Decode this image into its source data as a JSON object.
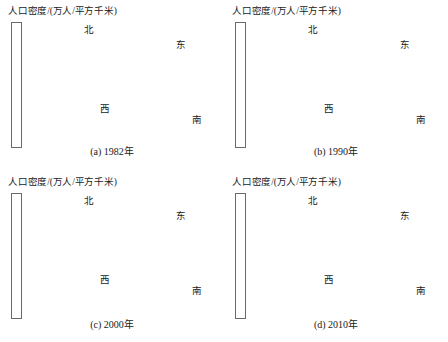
{
  "figure": {
    "background_color": "#ffffff",
    "panel_count": 4,
    "layout": "2x2 grid of 3D surface plots"
  },
  "chart_data": {
    "type": "heatmap",
    "title": "人口密度/(万人/平方千米)",
    "subtitle": "",
    "xlabel": "",
    "ylabel": "",
    "zlabel": "人口密度/(万人/平方千米)",
    "grid": false,
    "legend_position": "left",
    "colormap": "grayscale-inverted",
    "projection": "3d-surface",
    "direction_labels": {
      "north": "北",
      "east": "东",
      "west": "西",
      "south": "南"
    },
    "panels": [
      {
        "id": "a",
        "caption": "(a) 1982年",
        "year": 1982,
        "colorbar": {
          "title": "人口密度/(万人/平方千米)",
          "ticks": [
            11,
            10,
            9,
            8,
            7,
            6,
            5,
            4
          ],
          "vmin": 4,
          "vmax": 11.5
        },
        "peaks": [
          {
            "x": 0.42,
            "y": 0.3,
            "amp": 1.0,
            "sx": 0.045,
            "sy": 0.05
          },
          {
            "x": 0.5,
            "y": 0.47,
            "amp": 0.78,
            "sx": 0.038,
            "sy": 0.042
          },
          {
            "x": 0.57,
            "y": 0.45,
            "amp": 0.88,
            "sx": 0.04,
            "sy": 0.045
          },
          {
            "x": 0.63,
            "y": 0.5,
            "amp": 0.92,
            "sx": 0.045,
            "sy": 0.048
          },
          {
            "x": 0.36,
            "y": 0.52,
            "amp": 0.62,
            "sx": 0.04,
            "sy": 0.045
          },
          {
            "x": 0.46,
            "y": 0.62,
            "amp": 0.55,
            "sx": 0.042,
            "sy": 0.048
          },
          {
            "x": 0.58,
            "y": 0.66,
            "amp": 0.48,
            "sx": 0.045,
            "sy": 0.05
          },
          {
            "x": 0.72,
            "y": 0.63,
            "amp": 0.52,
            "sx": 0.042,
            "sy": 0.046
          },
          {
            "x": 0.3,
            "y": 0.38,
            "amp": 0.3,
            "sx": 0.09,
            "sy": 0.09
          },
          {
            "x": 0.55,
            "y": 0.5,
            "amp": 0.26,
            "sx": 0.18,
            "sy": 0.16
          }
        ],
        "base_level": 0.1
      },
      {
        "id": "b",
        "caption": "(b) 1990年",
        "year": 1990,
        "colorbar": {
          "title": "人口密度/(万人/平方千米)",
          "ticks": [
            11,
            10,
            9,
            8,
            7,
            6,
            5,
            4
          ],
          "vmin": 4,
          "vmax": 11.5
        },
        "peaks": [
          {
            "x": 0.4,
            "y": 0.26,
            "amp": 0.95,
            "sx": 0.048,
            "sy": 0.052
          },
          {
            "x": 0.48,
            "y": 0.44,
            "amp": 0.85,
            "sx": 0.04,
            "sy": 0.044
          },
          {
            "x": 0.55,
            "y": 0.42,
            "amp": 1.0,
            "sx": 0.042,
            "sy": 0.046
          },
          {
            "x": 0.61,
            "y": 0.46,
            "amp": 0.96,
            "sx": 0.044,
            "sy": 0.048
          },
          {
            "x": 0.67,
            "y": 0.44,
            "amp": 0.82,
            "sx": 0.04,
            "sy": 0.044
          },
          {
            "x": 0.34,
            "y": 0.5,
            "amp": 0.66,
            "sx": 0.044,
            "sy": 0.048
          },
          {
            "x": 0.44,
            "y": 0.6,
            "amp": 0.6,
            "sx": 0.044,
            "sy": 0.05
          },
          {
            "x": 0.6,
            "y": 0.62,
            "amp": 0.58,
            "sx": 0.046,
            "sy": 0.05
          },
          {
            "x": 0.74,
            "y": 0.58,
            "amp": 0.62,
            "sx": 0.044,
            "sy": 0.048
          },
          {
            "x": 0.28,
            "y": 0.36,
            "amp": 0.32,
            "sx": 0.095,
            "sy": 0.095
          },
          {
            "x": 0.55,
            "y": 0.48,
            "amp": 0.3,
            "sx": 0.19,
            "sy": 0.17
          }
        ],
        "base_level": 0.11
      },
      {
        "id": "c",
        "caption": "(c) 2000年",
        "year": 2000,
        "colorbar": {
          "title": "人口密度/(万人/平方千米)",
          "ticks": [
            11,
            10,
            9,
            8,
            7,
            6,
            5
          ],
          "vmin": 4,
          "vmax": 11.5
        },
        "peaks": [
          {
            "x": 0.44,
            "y": 0.24,
            "amp": 0.92,
            "sx": 0.06,
            "sy": 0.06
          },
          {
            "x": 0.5,
            "y": 0.4,
            "amp": 0.9,
            "sx": 0.05,
            "sy": 0.052
          },
          {
            "x": 0.56,
            "y": 0.42,
            "amp": 1.0,
            "sx": 0.048,
            "sy": 0.05
          },
          {
            "x": 0.62,
            "y": 0.44,
            "amp": 0.86,
            "sx": 0.05,
            "sy": 0.052
          },
          {
            "x": 0.36,
            "y": 0.46,
            "amp": 0.52,
            "sx": 0.06,
            "sy": 0.062
          },
          {
            "x": 0.46,
            "y": 0.58,
            "amp": 0.58,
            "sx": 0.055,
            "sy": 0.058
          },
          {
            "x": 0.62,
            "y": 0.6,
            "amp": 0.56,
            "sx": 0.055,
            "sy": 0.058
          },
          {
            "x": 0.74,
            "y": 0.52,
            "amp": 0.5,
            "sx": 0.055,
            "sy": 0.056
          },
          {
            "x": 0.3,
            "y": 0.34,
            "amp": 0.36,
            "sx": 0.1,
            "sy": 0.1
          },
          {
            "x": 0.54,
            "y": 0.46,
            "amp": 0.38,
            "sx": 0.2,
            "sy": 0.18
          }
        ],
        "base_level": 0.13
      },
      {
        "id": "d",
        "caption": "(d) 2010年",
        "year": 2010,
        "colorbar": {
          "title": "人口密度/(万人/平方千米)",
          "ticks": [
            11,
            10,
            9,
            8,
            7,
            6,
            5,
            4
          ],
          "vmin": 4,
          "vmax": 11.5
        },
        "peaks": [
          {
            "x": 0.46,
            "y": 0.22,
            "amp": 0.84,
            "sx": 0.075,
            "sy": 0.07
          },
          {
            "x": 0.5,
            "y": 0.38,
            "amp": 0.96,
            "sx": 0.058,
            "sy": 0.056
          },
          {
            "x": 0.56,
            "y": 0.4,
            "amp": 1.0,
            "sx": 0.06,
            "sy": 0.058
          },
          {
            "x": 0.62,
            "y": 0.42,
            "amp": 0.92,
            "sx": 0.058,
            "sy": 0.056
          },
          {
            "x": 0.4,
            "y": 0.44,
            "amp": 0.58,
            "sx": 0.07,
            "sy": 0.068
          },
          {
            "x": 0.48,
            "y": 0.56,
            "amp": 0.62,
            "sx": 0.065,
            "sy": 0.065
          },
          {
            "x": 0.64,
            "y": 0.56,
            "amp": 0.6,
            "sx": 0.065,
            "sy": 0.065
          },
          {
            "x": 0.76,
            "y": 0.5,
            "amp": 0.52,
            "sx": 0.062,
            "sy": 0.06
          },
          {
            "x": 0.3,
            "y": 0.4,
            "amp": 0.42,
            "sx": 0.11,
            "sy": 0.105
          },
          {
            "x": 0.55,
            "y": 0.44,
            "amp": 0.46,
            "sx": 0.22,
            "sy": 0.2
          }
        ],
        "base_level": 0.16
      }
    ]
  }
}
